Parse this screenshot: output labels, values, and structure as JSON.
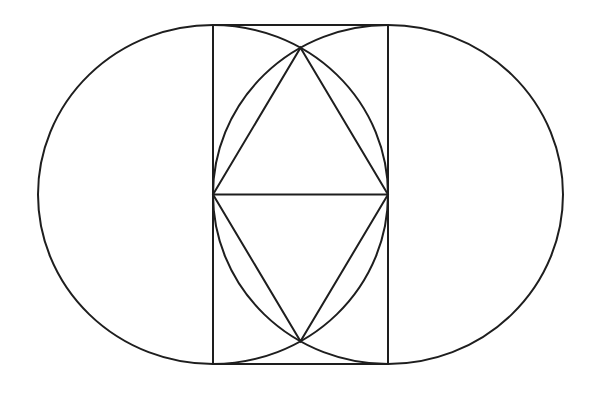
{
  "diagram": {
    "title": "",
    "stroke_color": "#1e1e1e",
    "background": "#ffffff",
    "shapes": {
      "left_circle": {
        "cx": 213,
        "cy": 194.5,
        "rx": 175,
        "ry": 169.5
      },
      "right_circle": {
        "cx": 388,
        "cy": 194.5,
        "rx": 175,
        "ry": 169.5
      },
      "rectangle": {
        "x": 213,
        "y": 25,
        "width": 175,
        "height": 339
      },
      "horizontal_diagonal": {
        "x1": 213,
        "y1": 194.5,
        "x2": 388,
        "y2": 194.5
      },
      "rhombus": {
        "points": [
          [
            300.5,
            47.7
          ],
          [
            388,
            194.5
          ],
          [
            300.5,
            341.3
          ],
          [
            213,
            194.5
          ]
        ]
      }
    }
  }
}
